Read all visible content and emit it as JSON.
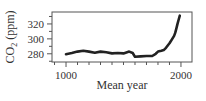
{
  "chart_data": {
    "type": "line",
    "title": "",
    "xlabel": "Mean year",
    "ylabel": "CO2 (ppm)",
    "ylabel_parts": {
      "main": "CO",
      "sub": "2",
      "unit": " (ppm)"
    },
    "xlim": [
      878,
      2096
    ],
    "ylim": [
      269,
      336
    ],
    "x_ticks": [
      1000,
      2000
    ],
    "x_tick_labels": [
      "1000",
      "2000"
    ],
    "x_minor_tick_step": 100,
    "y_ticks": [
      280,
      300,
      320
    ],
    "y_tick_labels": [
      "280",
      "300",
      "320"
    ],
    "y_minor_tick_step": 10,
    "grid": false,
    "legend": null,
    "series": [
      {
        "name": "CO2",
        "color": "#222222",
        "x": [
          1000,
          1050,
          1100,
          1150,
          1200,
          1250,
          1300,
          1350,
          1400,
          1450,
          1500,
          1550,
          1580,
          1600,
          1650,
          1700,
          1750,
          1780,
          1800,
          1830,
          1850,
          1870,
          1900,
          1920,
          1940,
          1950,
          1960,
          1970,
          1980,
          1990
        ],
        "values": [
          279.5,
          281,
          283,
          284,
          283,
          281.5,
          283,
          282,
          280.5,
          281,
          280.5,
          283,
          281,
          276,
          276.5,
          277,
          277,
          280,
          283,
          284,
          285,
          288,
          294,
          299,
          304,
          308,
          314,
          320,
          326,
          331
        ]
      }
    ]
  }
}
